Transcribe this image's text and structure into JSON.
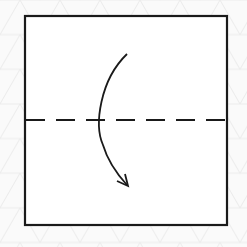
{
  "diagram": {
    "type": "origami-fold-step",
    "description": "Square paper with horizontal valley-fold dashed line at midpoint; curved arrow indicates folding top half down over the bottom half",
    "paper": {
      "shape": "square",
      "fill": "#ffffff",
      "stroke": "#1a1a1a"
    },
    "fold_line": {
      "style": "dashed",
      "orientation": "horizontal",
      "position": "middle",
      "color": "#1a1a1a"
    },
    "arrow": {
      "direction": "down",
      "shape": "curved",
      "color": "#1a1a1a"
    },
    "background": {
      "pattern": "triangular-grid",
      "color": "#ececec",
      "base": "#fafafa"
    }
  }
}
